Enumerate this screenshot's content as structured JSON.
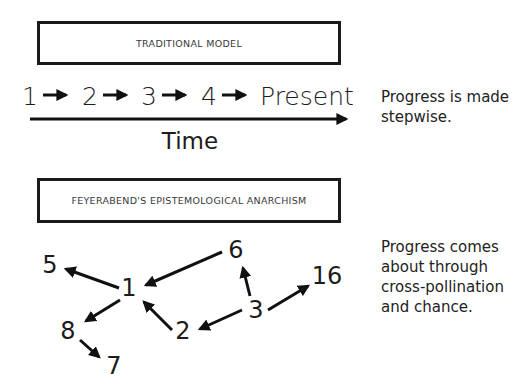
{
  "traditional": {
    "title": "TRADITIONAL MODEL",
    "sequence": [
      "1",
      "2",
      "3",
      "4",
      "Present"
    ],
    "axis_label": "Time",
    "caption": "Progress is made stepwise."
  },
  "feyerabend": {
    "title": "FEYERABEND'S EPISTEMOLOGICAL ANARCHISM",
    "nodes": [
      {
        "id": "5",
        "label": "5"
      },
      {
        "id": "1",
        "label": "1"
      },
      {
        "id": "8",
        "label": "8"
      },
      {
        "id": "7",
        "label": "7"
      },
      {
        "id": "2",
        "label": "2"
      },
      {
        "id": "6",
        "label": "6"
      },
      {
        "id": "3",
        "label": "3"
      },
      {
        "id": "16",
        "label": "16"
      }
    ],
    "edges": [
      {
        "from": "1",
        "to": "5"
      },
      {
        "from": "6",
        "to": "1"
      },
      {
        "from": "1",
        "to": "8"
      },
      {
        "from": "8",
        "to": "7"
      },
      {
        "from": "2",
        "to": "1"
      },
      {
        "from": "3",
        "to": "6"
      },
      {
        "from": "3",
        "to": "2"
      },
      {
        "from": "3",
        "to": "16"
      }
    ],
    "caption": "Progress comes about through cross-pollination and chance."
  }
}
